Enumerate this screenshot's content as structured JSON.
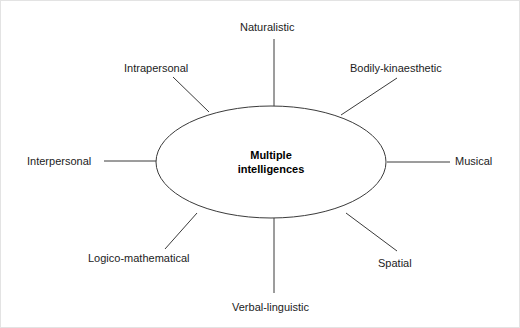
{
  "diagram": {
    "type": "spoke-hub",
    "center": {
      "id": "center",
      "line1": "Multiple",
      "line2": "intelligences",
      "text": "Multiple intelligences",
      "shape": "ellipse",
      "cx": 270,
      "cy": 161,
      "rx": 115,
      "ry": 56
    },
    "style": {
      "stroke_color": "#3a3a3a",
      "stroke_width": 1,
      "text_color": "#1c1c1c",
      "background": "#ffffff",
      "border_color": "#e3e3e3"
    },
    "nodes": [
      {
        "id": "naturalistic",
        "label": "Naturalistic",
        "position": "top",
        "connector": {
          "x1": 273,
          "y1": 38,
          "x2": 273,
          "y2": 106
        }
      },
      {
        "id": "intrapersonal",
        "label": "Intrapersonal",
        "position": "top-left",
        "connector": {
          "x1": 172,
          "y1": 76,
          "x2": 208,
          "y2": 111
        }
      },
      {
        "id": "bodily-kinaesthetic",
        "label": "Bodily-kinaesthetic",
        "position": "top-right",
        "connector": {
          "x1": 396,
          "y1": 77,
          "x2": 340,
          "y2": 114
        }
      },
      {
        "id": "interpersonal",
        "label": "Interpersonal",
        "position": "left",
        "connector": {
          "x1": 103,
          "y1": 160,
          "x2": 156,
          "y2": 160
        }
      },
      {
        "id": "musical",
        "label": "Musical",
        "position": "right",
        "connector": {
          "x1": 386,
          "y1": 161,
          "x2": 449,
          "y2": 161
        }
      },
      {
        "id": "logico-mathematical",
        "label": "Logico-mathematical",
        "position": "bottom-left",
        "connector": {
          "x1": 164,
          "y1": 248,
          "x2": 196,
          "y2": 212
        }
      },
      {
        "id": "spatial",
        "label": "Spatial",
        "position": "bottom-right",
        "connector": {
          "x1": 345,
          "y1": 212,
          "x2": 396,
          "y2": 250
        }
      },
      {
        "id": "verbal-linguistic",
        "label": "Verbal-linguistic",
        "position": "bottom",
        "connector": {
          "x1": 273,
          "y1": 217,
          "x2": 273,
          "y2": 292
        }
      }
    ]
  }
}
